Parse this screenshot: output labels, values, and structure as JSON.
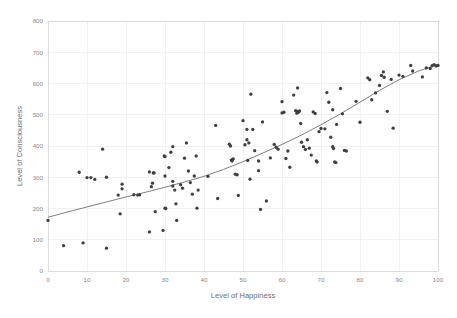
{
  "chart_data": {
    "type": "scatter",
    "title": "",
    "xlabel": "Level of Happiness",
    "ylabel": "Level of Consciousness",
    "xlim": [
      0,
      100
    ],
    "ylim": [
      0,
      800
    ],
    "xticks": [
      0,
      10,
      20,
      30,
      40,
      50,
      60,
      70,
      80,
      90,
      100
    ],
    "yticks": [
      0,
      100,
      200,
      300,
      400,
      500,
      600,
      700,
      800
    ],
    "grid": true,
    "legend": "none",
    "marker_color": "#3f3f42",
    "trendline_color": "#6f6f72",
    "gridline_color": "#ededf0",
    "points": [
      [
        0,
        162
      ],
      [
        4,
        81
      ],
      [
        8,
        316
      ],
      [
        9,
        90
      ],
      [
        10,
        299
      ],
      [
        11,
        299
      ],
      [
        12,
        293
      ],
      [
        14,
        390
      ],
      [
        15,
        73
      ],
      [
        15,
        300
      ],
      [
        18,
        243
      ],
      [
        18.5,
        183
      ],
      [
        19,
        278
      ],
      [
        19,
        263
      ],
      [
        22,
        244
      ],
      [
        23,
        243
      ],
      [
        23.5,
        244
      ],
      [
        26,
        317
      ],
      [
        26,
        125
      ],
      [
        26.5,
        270
      ],
      [
        26.8,
        281
      ],
      [
        27,
        314
      ],
      [
        27.2,
        314
      ],
      [
        27.5,
        190
      ],
      [
        29.5,
        130
      ],
      [
        29.8,
        368
      ],
      [
        30,
        366
      ],
      [
        30,
        304
      ],
      [
        30,
        201
      ],
      [
        30.2,
        200
      ],
      [
        31,
        331
      ],
      [
        31.5,
        380
      ],
      [
        32,
        398
      ],
      [
        32,
        287
      ],
      [
        32,
        272
      ],
      [
        32.5,
        259
      ],
      [
        32.8,
        215
      ],
      [
        33,
        162
      ],
      [
        34,
        276
      ],
      [
        34.5,
        265
      ],
      [
        35,
        361
      ],
      [
        35.5,
        410
      ],
      [
        36,
        320
      ],
      [
        36.5,
        283
      ],
      [
        37,
        246
      ],
      [
        37.5,
        304
      ],
      [
        38,
        368
      ],
      [
        38.2,
        201
      ],
      [
        38.5,
        259
      ],
      [
        41,
        303
      ],
      [
        43,
        466
      ],
      [
        43.5,
        232
      ],
      [
        46.5,
        406
      ],
      [
        46.8,
        400
      ],
      [
        47,
        355
      ],
      [
        47.2,
        352
      ],
      [
        47.3,
        357
      ],
      [
        47.5,
        359
      ],
      [
        48,
        310
      ],
      [
        48.5,
        308
      ],
      [
        48.8,
        242
      ],
      [
        50,
        481
      ],
      [
        50.5,
        404
      ],
      [
        51,
        453
      ],
      [
        51,
        420
      ],
      [
        51.2,
        354
      ],
      [
        51.5,
        410
      ],
      [
        51.8,
        294
      ],
      [
        52,
        566
      ],
      [
        52.5,
        453
      ],
      [
        53,
        385
      ],
      [
        54,
        321
      ],
      [
        54,
        352
      ],
      [
        54.5,
        197
      ],
      [
        55,
        477
      ],
      [
        56,
        224
      ],
      [
        57,
        362
      ],
      [
        58,
        405
      ],
      [
        58.5,
        396
      ],
      [
        59,
        390
      ],
      [
        60,
        542
      ],
      [
        60,
        506
      ],
      [
        60.5,
        508
      ],
      [
        61,
        360
      ],
      [
        61.5,
        384
      ],
      [
        62,
        332
      ],
      [
        63,
        563
      ],
      [
        63.5,
        513
      ],
      [
        63.8,
        505
      ],
      [
        64,
        586
      ],
      [
        64,
        511
      ],
      [
        64.2,
        508
      ],
      [
        64.5,
        512
      ],
      [
        64.8,
        472
      ],
      [
        65,
        412
      ],
      [
        65.5,
        398
      ],
      [
        66,
        389
      ],
      [
        66.5,
        420
      ],
      [
        67,
        393
      ],
      [
        67.5,
        371
      ],
      [
        68,
        509
      ],
      [
        68.5,
        504
      ],
      [
        68.8,
        352
      ],
      [
        69,
        349
      ],
      [
        69.5,
        446
      ],
      [
        70,
        456
      ],
      [
        71,
        455
      ],
      [
        71.5,
        571
      ],
      [
        72,
        540
      ],
      [
        72.5,
        428
      ],
      [
        73,
        516
      ],
      [
        73,
        398
      ],
      [
        73.2,
        392
      ],
      [
        73.5,
        349
      ],
      [
        73.8,
        347
      ],
      [
        74,
        469
      ],
      [
        75,
        584
      ],
      [
        75.5,
        503
      ],
      [
        76,
        386
      ],
      [
        76.5,
        384
      ],
      [
        79,
        543
      ],
      [
        80,
        476
      ],
      [
        82,
        618
      ],
      [
        82.5,
        612
      ],
      [
        83,
        548
      ],
      [
        84,
        570
      ],
      [
        85,
        594
      ],
      [
        85.5,
        626
      ],
      [
        86,
        637
      ],
      [
        86.2,
        620
      ],
      [
        87,
        511
      ],
      [
        88,
        613
      ],
      [
        88.5,
        457
      ],
      [
        90,
        627
      ],
      [
        91,
        623
      ],
      [
        93,
        658
      ],
      [
        93.5,
        640
      ],
      [
        96,
        621
      ],
      [
        97,
        650
      ],
      [
        98,
        648
      ],
      [
        98.5,
        657
      ],
      [
        99,
        660
      ],
      [
        99.5,
        656
      ],
      [
        100,
        658
      ]
    ],
    "trendline": [
      [
        0,
        172
      ],
      [
        5,
        189
      ],
      [
        10,
        205
      ],
      [
        15,
        221
      ],
      [
        20,
        237
      ],
      [
        25,
        252
      ],
      [
        30,
        268
      ],
      [
        35,
        285
      ],
      [
        40,
        303
      ],
      [
        45,
        325
      ],
      [
        50,
        350
      ],
      [
        55,
        377
      ],
      [
        60,
        405
      ],
      [
        65,
        435
      ],
      [
        70,
        468
      ],
      [
        75,
        503
      ],
      [
        80,
        540
      ],
      [
        85,
        578
      ],
      [
        90,
        612
      ],
      [
        95,
        640
      ],
      [
        100,
        661
      ]
    ]
  }
}
